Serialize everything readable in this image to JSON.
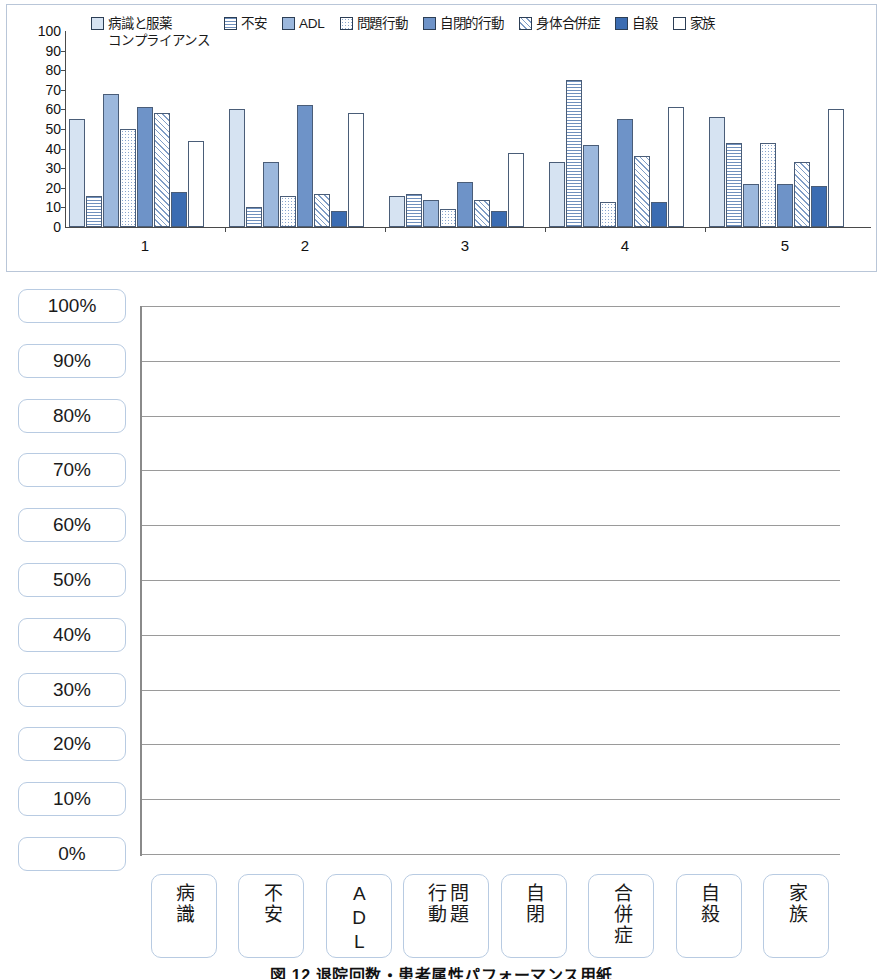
{
  "figure": {
    "caption": "図 12  退院回数・患者属性パフォーマンス用紙"
  },
  "chart_data": [
    {
      "type": "bar",
      "title": "",
      "xlabel": "",
      "ylabel": "",
      "ylim": [
        0,
        100
      ],
      "ytick_step": 10,
      "grid": false,
      "legend_position": "top",
      "categories": [
        "1",
        "2",
        "3",
        "4",
        "5"
      ],
      "series": [
        {
          "name": "病識と服薬コンプライアンス",
          "pattern": "solid-light-blue",
          "color": "#d6e3f2",
          "values": [
            55,
            60,
            16,
            33,
            56
          ]
        },
        {
          "name": "不安",
          "pattern": "horizontal-lines",
          "color": "#6f90bd",
          "values": [
            16,
            10,
            17,
            75,
            43
          ]
        },
        {
          "name": "ADL",
          "pattern": "solid-medium-blue",
          "color": "#9cb8dd",
          "values": [
            68,
            33,
            14,
            42,
            22
          ]
        },
        {
          "name": "問題行動",
          "pattern": "dotted",
          "color": "#8aa7cf",
          "values": [
            50,
            16,
            9,
            13,
            43
          ]
        },
        {
          "name": "自閉的行動",
          "pattern": "solid-blue",
          "color": "#6e93c8",
          "values": [
            61,
            62,
            23,
            55,
            22
          ]
        },
        {
          "name": "身体合併症",
          "pattern": "diagonal-hatch",
          "color": "#7e9cc6",
          "values": [
            58,
            17,
            14,
            36,
            33
          ]
        },
        {
          "name": "自殺",
          "pattern": "solid-dark-blue",
          "color": "#3b6cb2",
          "values": [
            18,
            8,
            8,
            13,
            21
          ]
        },
        {
          "name": "家族",
          "pattern": "white",
          "color": "#ffffff",
          "values": [
            44,
            58,
            38,
            61,
            60
          ]
        }
      ],
      "ytick_labels": [
        "100",
        "90",
        "80",
        "70",
        "60",
        "50",
        "40",
        "30",
        "20",
        "10",
        "0"
      ]
    },
    {
      "type": "table",
      "title": "",
      "description": "blank performance worksheet grid",
      "ytick_labels": [
        "100%",
        "90%",
        "80%",
        "70%",
        "60%",
        "50%",
        "40%",
        "30%",
        "20%",
        "10%",
        "0%"
      ],
      "ylim": [
        0,
        100
      ],
      "grid": true,
      "categories": [
        "病識",
        "不安",
        "ADL",
        "問題行動",
        "自閉",
        "合併症",
        "自殺",
        "家族"
      ],
      "values": []
    }
  ],
  "top_chart": {
    "legend_items": [
      {
        "label": "病識と服薬",
        "label2": "コンプライアンス",
        "swatch": "legend-swatch-byoshiki"
      },
      {
        "label": "不安",
        "label2": "",
        "swatch": "legend-swatch-fuan"
      },
      {
        "label": "ADL",
        "label2": "",
        "swatch": "legend-swatch-adl"
      },
      {
        "label": "問題行動",
        "label2": "",
        "swatch": "legend-swatch-mondai"
      },
      {
        "label": "自閉的行動",
        "label2": "",
        "swatch": "legend-swatch-jihei"
      },
      {
        "label": "身体合併症",
        "label2": "",
        "swatch": "legend-swatch-gappei"
      },
      {
        "label": "自殺",
        "label2": "",
        "swatch": "legend-swatch-jisatsu"
      },
      {
        "label": "家族",
        "label2": "",
        "swatch": "legend-swatch-kazoku"
      }
    ]
  },
  "bottom_sheet": {
    "y_labels": [
      "100%",
      "90%",
      "80%",
      "70%",
      "60%",
      "50%",
      "40%",
      "30%",
      "20%",
      "10%",
      "0%"
    ],
    "x_labels": [
      {
        "col1": "病識",
        "col2": ""
      },
      {
        "col1": "不安",
        "col2": ""
      },
      {
        "col1": "ADL",
        "col2": "",
        "latin": true
      },
      {
        "col1": "問題",
        "col2": "行動"
      },
      {
        "col1": "自閉",
        "col2": ""
      },
      {
        "col1": "合併症",
        "col2": ""
      },
      {
        "col1": "自殺",
        "col2": ""
      },
      {
        "col1": "家族",
        "col2": ""
      }
    ]
  }
}
